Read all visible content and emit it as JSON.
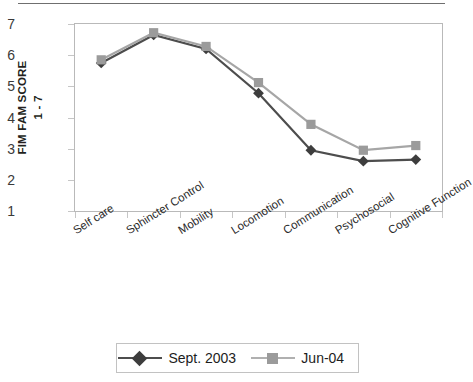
{
  "axis": {
    "y_title_line1": "FIM FAM SCORE",
    "y_title_line2": "1 - 7",
    "y_ticks": [
      "7",
      "6",
      "5",
      "4",
      "3",
      "2",
      "1"
    ]
  },
  "legend": {
    "items": [
      {
        "label": "Sept. 2003",
        "color": "#4d4d4d",
        "marker": "diamond"
      },
      {
        "label": "Jun-04",
        "color": "#a6a6a6",
        "marker": "square"
      }
    ]
  },
  "chart_data": {
    "type": "line",
    "title": "",
    "xlabel": "",
    "ylabel": "FIM FAM SCORE 1 - 7",
    "ylim": [
      1,
      7
    ],
    "yticks": [
      1,
      2,
      3,
      4,
      5,
      6,
      7
    ],
    "grid": false,
    "legend_position": "bottom",
    "categories": [
      "Self care",
      "Sphincter Control",
      "Mobility",
      "Locomotion",
      "Communication",
      "Psychosocial",
      "Cognitive Function"
    ],
    "series": [
      {
        "name": "Sept. 2003",
        "color": "#4d4d4d",
        "marker": "diamond",
        "values": [
          5.75,
          6.65,
          6.2,
          4.78,
          2.95,
          2.6,
          2.65
        ]
      },
      {
        "name": "Jun-04",
        "color": "#a6a6a6",
        "marker": "square",
        "values": [
          5.85,
          6.72,
          6.28,
          5.12,
          3.78,
          2.95,
          3.1
        ]
      }
    ]
  }
}
